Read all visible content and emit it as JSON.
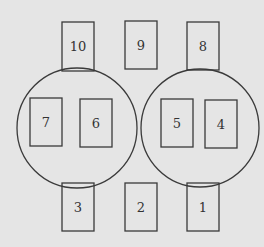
{
  "diagram": {
    "background": "#e5e5e5",
    "stroke": "#3a3a3a",
    "circles": [
      {
        "name": "left-group-circle",
        "cx": 77,
        "cy": 128,
        "r": 60,
        "contains": [
          "7",
          "6"
        ]
      },
      {
        "name": "right-group-circle",
        "cx": 200,
        "cy": 128,
        "r": 59,
        "contains": [
          "5",
          "4"
        ]
      }
    ],
    "boxes": [
      {
        "label": "10",
        "x": 62,
        "y": 22,
        "w": 32,
        "h": 49
      },
      {
        "label": "9",
        "x": 125,
        "y": 21,
        "w": 32,
        "h": 48
      },
      {
        "label": "8",
        "x": 187,
        "y": 22,
        "w": 32,
        "h": 48
      },
      {
        "label": "7",
        "x": 30,
        "y": 98,
        "w": 32,
        "h": 48
      },
      {
        "label": "6",
        "x": 80,
        "y": 99,
        "w": 32,
        "h": 48
      },
      {
        "label": "5",
        "x": 161,
        "y": 99,
        "w": 32,
        "h": 48
      },
      {
        "label": "4",
        "x": 205,
        "y": 100,
        "w": 32,
        "h": 48
      },
      {
        "label": "3",
        "x": 62,
        "y": 183,
        "w": 32,
        "h": 48
      },
      {
        "label": "2",
        "x": 125,
        "y": 183,
        "w": 32,
        "h": 48
      },
      {
        "label": "1",
        "x": 187,
        "y": 183,
        "w": 32,
        "h": 48
      }
    ]
  }
}
